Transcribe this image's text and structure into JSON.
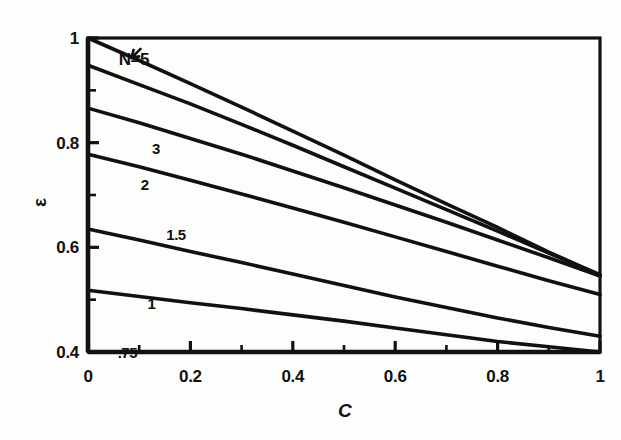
{
  "figure": {
    "background_color": "#fdfdfc",
    "line_color": "#111111",
    "axis_color": "#111111"
  },
  "axes": {
    "x_title": "C",
    "y_title": "ε",
    "x_ticks_labeled": [
      "0",
      "0.2",
      "0.4",
      "0.6",
      "0.8",
      "1"
    ],
    "y_ticks_labeled": [
      "0.4",
      "0.6",
      "0.8",
      "1"
    ]
  },
  "chart_data": {
    "type": "line",
    "title": "",
    "subtitle": "",
    "xlabel": "C",
    "ylabel": "ε",
    "xlim": [
      0,
      1
    ],
    "ylim": [
      0.4,
      1.0
    ],
    "xticks": [
      0,
      0.1,
      0.2,
      0.3,
      0.4,
      0.5,
      0.6,
      0.7,
      0.8,
      0.9,
      1
    ],
    "xticklabels": [
      "0",
      "",
      "0.2",
      "",
      "0.4",
      "",
      "0.6",
      "",
      "0.8",
      "",
      "1"
    ],
    "yticks": [
      0.4,
      0.5,
      0.6,
      0.7,
      0.8,
      0.9,
      1.0
    ],
    "yticklabels": [
      "0.4",
      "",
      "0.6",
      "",
      "0.8",
      "",
      "1"
    ],
    "grid": false,
    "legend": "inline-curve-labels",
    "annotations": [
      {
        "text": "N=5",
        "x": 0.06,
        "y": 0.975,
        "note": "arrow points down-left to topmost curve"
      }
    ],
    "series": [
      {
        "name": "N=5",
        "label": "N=5",
        "label_x": 0.06,
        "label_y": 0.975,
        "x": [
          0,
          0.1,
          0.2,
          0.3,
          0.4,
          0.5,
          0.6,
          0.7,
          0.8,
          0.9,
          1
        ],
        "values": [
          1.0,
          0.957,
          0.913,
          0.868,
          0.822,
          0.776,
          0.729,
          0.683,
          0.638,
          0.591,
          0.547
        ]
      },
      {
        "name": "N=3",
        "label": "3",
        "label_x": 0.125,
        "label_y": 0.803,
        "x": [
          0,
          0.1,
          0.2,
          0.3,
          0.4,
          0.5,
          0.6,
          0.7,
          0.8,
          0.9,
          1
        ],
        "values": [
          0.948,
          0.911,
          0.874,
          0.835,
          0.795,
          0.754,
          0.713,
          0.672,
          0.631,
          0.589,
          0.548
        ]
      },
      {
        "name": "N=2",
        "label": "2",
        "label_x": 0.103,
        "label_y": 0.735,
        "x": [
          0,
          0.1,
          0.2,
          0.3,
          0.4,
          0.5,
          0.6,
          0.7,
          0.8,
          0.9,
          1
        ],
        "values": [
          0.866,
          0.838,
          0.808,
          0.778,
          0.746,
          0.714,
          0.681,
          0.648,
          0.614,
          0.58,
          0.545
        ]
      },
      {
        "name": "N=1.5",
        "label": "1.5",
        "label_x": 0.153,
        "label_y": 0.638,
        "x": [
          0,
          0.1,
          0.2,
          0.3,
          0.4,
          0.5,
          0.6,
          0.7,
          0.8,
          0.9,
          1
        ],
        "values": [
          0.778,
          0.754,
          0.728,
          0.702,
          0.675,
          0.648,
          0.62,
          0.592,
          0.564,
          0.536,
          0.51
        ]
      },
      {
        "name": "N=1",
        "label": "1",
        "label_x": 0.116,
        "label_y": 0.507,
        "x": [
          0,
          0.1,
          0.2,
          0.3,
          0.4,
          0.5,
          0.6,
          0.7,
          0.8,
          0.9,
          1
        ],
        "values": [
          0.635,
          0.614,
          0.592,
          0.571,
          0.549,
          0.527,
          0.505,
          0.485,
          0.465,
          0.447,
          0.43
        ]
      },
      {
        "name": "N=.75",
        "label": ".75",
        "label_x": 0.058,
        "label_y": 0.414,
        "x": [
          0,
          0.1,
          0.2,
          0.3,
          0.4,
          0.5,
          0.6,
          0.7,
          0.8,
          0.9,
          1
        ],
        "values": [
          0.518,
          0.506,
          0.494,
          0.483,
          0.471,
          0.459,
          0.446,
          0.433,
          0.42,
          0.41,
          0.4
        ]
      }
    ]
  }
}
